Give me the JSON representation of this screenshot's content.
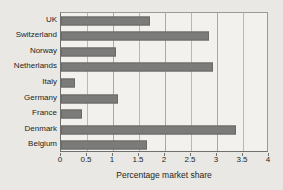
{
  "chart_data": {
    "type": "bar",
    "orientation": "horizontal",
    "title": "",
    "subtitle": "",
    "xlabel": "Percentage market share",
    "ylabel": "",
    "categories": [
      "UK",
      "Switzerland",
      "Norway",
      "Netherlands",
      "Italy",
      "Germany",
      "France",
      "Denmark",
      "Belgium"
    ],
    "values": [
      1.72,
      2.85,
      1.06,
      2.92,
      0.27,
      1.1,
      0.4,
      3.37,
      1.65
    ],
    "xlim": [
      0,
      4
    ],
    "xticks": [
      0,
      0.5,
      1,
      1.5,
      2,
      2.5,
      3,
      3.5,
      4
    ],
    "xtick_labels": [
      "0",
      "0.5",
      "1",
      "1.5",
      "2",
      "2.5",
      "3",
      "3.5",
      "4"
    ],
    "grid": true,
    "grid_axis": "x",
    "legend": false,
    "legend_position": "none",
    "annotations": []
  },
  "colors": {
    "background": "#e9e8e4",
    "plot_background": "#f2f1ee",
    "bar_fill": "#7b7b79",
    "bar_stroke": "#6a6a68",
    "gridline": "#b9b8b4",
    "axis": "#6f6f6c",
    "text": "#262421"
  }
}
